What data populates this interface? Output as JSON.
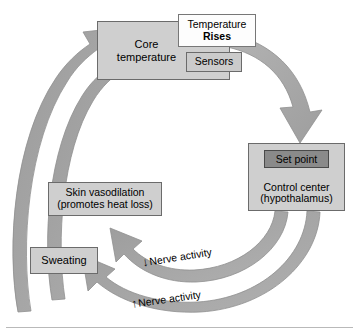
{
  "diagram": {
    "colors": {
      "box_fill": "#cfcfcf",
      "box_border": "#6b6b6b",
      "highlight_fill": "#8a8a8a",
      "white_box_fill": "#fdfdfd",
      "arrow_fill": "#a8a8a8",
      "arrow_stroke": "#8f8f8f",
      "text": "#000000",
      "rule": "#b9b9b9"
    },
    "nodes": {
      "core_temperature": {
        "label_line1": "Core",
        "label_line2": "temperature"
      },
      "temperature_rises": {
        "label_line1": "Temperature",
        "label_line2": "Rises"
      },
      "sensors": {
        "label": "Sensors"
      },
      "set_point": {
        "label": "Set point"
      },
      "control_center": {
        "label_line1": "Control center",
        "label_line2": "(hypothalamus)"
      },
      "skin_vasodilation": {
        "label_line1": "Skin vasodilation",
        "label_line2": "(promotes heat loss)"
      },
      "sweating": {
        "label": "Sweating"
      }
    },
    "edge_labels": {
      "nerve_activity_upper": {
        "arrow_glyph": "↓",
        "text": "Nerve activity"
      },
      "nerve_activity_lower": {
        "arrow_glyph": "↑",
        "text": "Nerve activity"
      }
    }
  }
}
